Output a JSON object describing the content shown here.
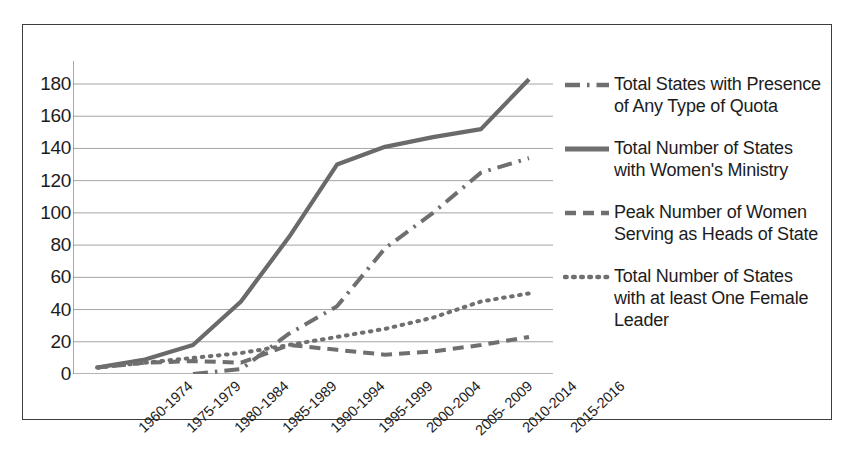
{
  "chart_data": {
    "type": "line",
    "title": "",
    "xlabel": "",
    "ylabel": "",
    "ylim": [
      0,
      190
    ],
    "yticks": [
      0,
      20,
      40,
      60,
      80,
      100,
      120,
      140,
      160,
      180
    ],
    "grid": true,
    "legend_position": "right",
    "categories": [
      "1960-1974",
      "1975-1979",
      "1980-1984",
      "1985-1989",
      "1990-1994",
      "1995-1999",
      "2000-2004",
      "2005- 2009",
      "2010-2014",
      "2015-2016"
    ],
    "series": [
      {
        "name": "Total States with Presence of Any Type of Quota",
        "style": "dash-dot",
        "color": "#6f6f6f",
        "values": [
          0,
          0,
          0,
          3,
          25,
          42,
          78,
          100,
          125,
          134
        ]
      },
      {
        "name": "Total Number of States with Women's Ministry",
        "style": "solid",
        "color": "#6a6a6a",
        "values": [
          4,
          9,
          18,
          45,
          85,
          130,
          141,
          147,
          152,
          183
        ]
      },
      {
        "name": "Peak Number of Women Serving as Heads of State",
        "style": "dashed",
        "color": "#6f6f6f",
        "values": [
          4,
          7,
          8,
          7,
          18,
          15,
          12,
          14,
          18,
          23
        ]
      },
      {
        "name": "Total Number of States with at least One Female Leader",
        "style": "dotted",
        "color": "#6f6f6f",
        "values": [
          4,
          7,
          10,
          13,
          18,
          23,
          28,
          35,
          45,
          50
        ]
      }
    ]
  },
  "legend": {
    "entries": [
      {
        "label": "Total States with Presence of Any Type of Quota",
        "style": "dash-dot"
      },
      {
        "label": "Total Number of States with Women's Ministry",
        "style": "solid"
      },
      {
        "label": "Peak Number of Women Serving as Heads of State",
        "style": "dashed"
      },
      {
        "label": "Total Number of States with at least One Female Leader",
        "style": "dotted"
      }
    ]
  }
}
